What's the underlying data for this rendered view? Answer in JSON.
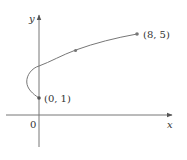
{
  "diagram": {
    "type": "parametric-curve",
    "axes": {
      "x_label": "x",
      "y_label": "y",
      "origin_label": "0"
    },
    "points": [
      {
        "label": "(0, 1)",
        "x": 0,
        "y": 1
      },
      {
        "label": "(8, 5)",
        "x": 8,
        "y": 5
      }
    ],
    "marked_intermediate_point": {
      "x": 3,
      "y": 4
    },
    "colors": {
      "axis": "#555555",
      "curve": "#666666",
      "point": "#555555",
      "text": "#333333"
    }
  }
}
